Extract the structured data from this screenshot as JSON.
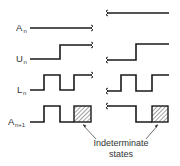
{
  "diagram": {
    "type": "timing-diagram",
    "signals": [
      {
        "name": "A",
        "subscript": "n",
        "left": "constant low",
        "right": "constant high"
      },
      {
        "name": "U",
        "subscript": "n",
        "left": "low then rises",
        "right": "low then rises"
      },
      {
        "name": "L",
        "subscript": "n",
        "left": "pulse train",
        "right": "pulse train"
      },
      {
        "name": "A",
        "subscript": "n+1",
        "left": "pulse then indeterminate",
        "right": "high, falls, then indeterminate"
      }
    ],
    "annotation": {
      "line1": "Indeterminate",
      "line2": "states"
    },
    "colors": {
      "line": "#1a1a1a",
      "text": "#333333",
      "background": "#ffffff"
    }
  }
}
